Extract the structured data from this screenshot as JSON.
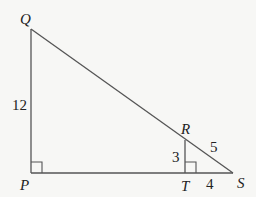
{
  "diagram": {
    "type": "geometry-similar-right-triangles",
    "stroke_color": "#555555",
    "text_color": "#222222",
    "background": "#f7f7f5",
    "points": {
      "Q": {
        "label": "Q",
        "x": 31,
        "y": 29
      },
      "P": {
        "label": "P",
        "x": 31,
        "y": 173
      },
      "S": {
        "label": "S",
        "x": 233,
        "y": 173
      },
      "T": {
        "label": "T",
        "x": 185,
        "y": 173
      },
      "R": {
        "label": "R",
        "x": 185,
        "y": 140
      }
    },
    "segments": [
      {
        "from": "Q",
        "to": "P"
      },
      {
        "from": "P",
        "to": "S"
      },
      {
        "from": "Q",
        "to": "S"
      },
      {
        "from": "R",
        "to": "T"
      }
    ],
    "right_angles": [
      "P",
      "T"
    ],
    "lengths": {
      "PQ": "12",
      "RT": "3",
      "RS": "5",
      "TS": "4"
    }
  }
}
